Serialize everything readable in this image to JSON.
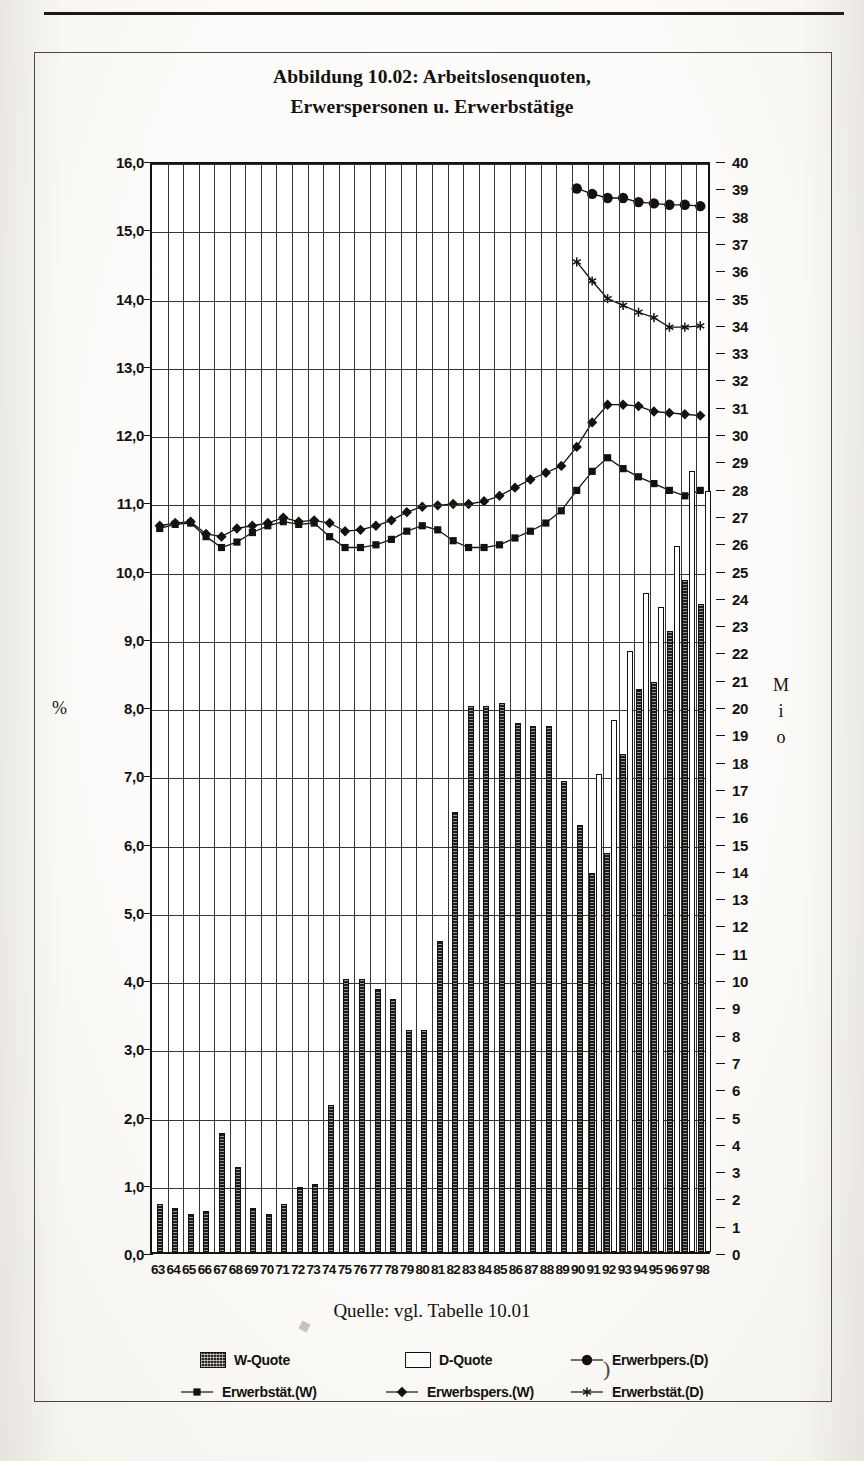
{
  "page": {
    "caption": "Quelle: vgl. Tabelle 10.01"
  },
  "title": {
    "line1": "Abbildung 10.02: Arbeitslosenquoten,",
    "line2": "Erwerspersonen u. Erwerbstätige"
  },
  "axes": {
    "left_title": "%",
    "right_title_chars": [
      "M",
      "i",
      "o"
    ],
    "left_ticks": [
      "16,0",
      "15,0",
      "14,0",
      "13,0",
      "12,0",
      "11,0",
      "10,0",
      "9,0",
      "8,0",
      "7,0",
      "6,0",
      "5,0",
      "4,0",
      "3,0",
      "2,0",
      "1,0",
      "0,0"
    ],
    "right_ticks": [
      "40",
      "39",
      "38",
      "37",
      "36",
      "35",
      "34",
      "33",
      "32",
      "31",
      "30",
      "29",
      "28",
      "27",
      "26",
      "25",
      "24",
      "23",
      "22",
      "21",
      "20",
      "19",
      "18",
      "17",
      "16",
      "15",
      "14",
      "13",
      "12",
      "11",
      "10",
      "9",
      "8",
      "7",
      "6",
      "5",
      "4",
      "3",
      "2",
      "1",
      "0"
    ]
  },
  "legend": {
    "items": [
      {
        "label": "W-Quote",
        "marker": "hatched-square-swatch"
      },
      {
        "label": "D-Quote",
        "marker": "white-square-swatch"
      },
      {
        "label": "Erwerbpers.(D)",
        "marker": "line-filled-circle"
      },
      {
        "label": "Erwerbstät.(W)",
        "marker": "line-small-square"
      },
      {
        "label": "Erwerbspers.(W)",
        "marker": "line-diamond"
      },
      {
        "label": "Erwerbstät.(D)",
        "marker": "line-asterisk"
      }
    ]
  },
  "chart_data": {
    "type": "bar",
    "title": "Abbildung 10.02: Arbeitslosenquoten, Erwerspersonen u. Erwerbstätige",
    "xlabel": "",
    "ylabel": "%",
    "y2label": "Mio",
    "ylim": [
      0,
      16
    ],
    "y2lim": [
      0,
      40
    ],
    "grid": true,
    "legend_position": "bottom",
    "categories": [
      "63",
      "64",
      "65",
      "66",
      "67",
      "68",
      "69",
      "70",
      "71",
      "72",
      "73",
      "74",
      "75",
      "76",
      "77",
      "78",
      "79",
      "80",
      "81",
      "82",
      "83",
      "84",
      "85",
      "86",
      "87",
      "88",
      "89",
      "90",
      "91",
      "92",
      "93",
      "94",
      "95",
      "96",
      "97",
      "98"
    ],
    "series": [
      {
        "name": "W-Quote",
        "type": "bar",
        "axis": "left",
        "unit": "%",
        "values": [
          0.7,
          0.65,
          0.55,
          0.6,
          1.75,
          1.25,
          0.65,
          0.55,
          0.7,
          0.95,
          1.0,
          2.15,
          4.0,
          4.0,
          3.85,
          3.7,
          3.25,
          3.25,
          4.55,
          6.45,
          8.0,
          8.0,
          8.05,
          7.75,
          7.7,
          7.7,
          6.9,
          6.25,
          5.55,
          5.85,
          7.3,
          8.25,
          8.35,
          9.1,
          9.85,
          9.5
        ]
      },
      {
        "name": "D-Quote",
        "type": "bar",
        "axis": "left",
        "unit": "%",
        "values": [
          null,
          null,
          null,
          null,
          null,
          null,
          null,
          null,
          null,
          null,
          null,
          null,
          null,
          null,
          null,
          null,
          null,
          null,
          null,
          null,
          null,
          null,
          null,
          null,
          null,
          null,
          null,
          null,
          7.0,
          7.8,
          8.8,
          9.65,
          9.45,
          10.35,
          11.45,
          11.15
        ]
      },
      {
        "name": "Erwerbspers.(W)",
        "type": "line",
        "axis": "right",
        "unit": "Mio",
        "marker": "diamond",
        "values": [
          26.7,
          26.8,
          26.85,
          26.4,
          26.3,
          26.6,
          26.7,
          26.8,
          27.0,
          26.85,
          26.9,
          26.8,
          26.5,
          26.55,
          26.7,
          26.9,
          27.2,
          27.4,
          27.45,
          27.5,
          27.5,
          27.6,
          27.8,
          28.1,
          28.4,
          28.65,
          28.9,
          29.6,
          30.5,
          31.15,
          31.15,
          31.1,
          30.9,
          30.85,
          30.8,
          30.75
        ]
      },
      {
        "name": "Erwerbstät.(W)",
        "type": "line",
        "axis": "right",
        "unit": "Mio",
        "marker": "square",
        "values": [
          26.6,
          26.75,
          26.8,
          26.3,
          25.9,
          26.1,
          26.45,
          26.7,
          26.85,
          26.75,
          26.8,
          26.3,
          25.9,
          25.9,
          26.0,
          26.2,
          26.5,
          26.7,
          26.55,
          26.15,
          25.9,
          25.9,
          26.0,
          26.25,
          26.5,
          26.8,
          27.25,
          28.0,
          28.7,
          29.2,
          28.8,
          28.5,
          28.25,
          28.0,
          27.8,
          28.0
        ]
      },
      {
        "name": "Erwerbpers.(D)",
        "type": "line",
        "axis": "right",
        "unit": "Mio",
        "marker": "circle",
        "values": [
          null,
          null,
          null,
          null,
          null,
          null,
          null,
          null,
          null,
          null,
          null,
          null,
          null,
          null,
          null,
          null,
          null,
          null,
          null,
          null,
          null,
          null,
          null,
          null,
          null,
          null,
          null,
          39.1,
          38.9,
          38.75,
          38.75,
          38.6,
          38.55,
          38.5,
          38.5,
          38.45
        ]
      },
      {
        "name": "Erwerbstät.(D)",
        "type": "line",
        "axis": "right",
        "unit": "Mio",
        "marker": "asterisk",
        "values": [
          null,
          null,
          null,
          null,
          null,
          null,
          null,
          null,
          null,
          null,
          null,
          null,
          null,
          null,
          null,
          null,
          null,
          null,
          null,
          null,
          null,
          null,
          null,
          null,
          null,
          null,
          null,
          36.4,
          35.7,
          35.05,
          34.8,
          34.55,
          34.35,
          34.0,
          34.0,
          34.05
        ]
      }
    ]
  }
}
